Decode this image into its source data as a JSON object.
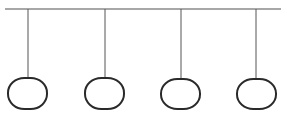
{
  "diagram": {
    "title": "",
    "colors": {
      "background": "#ffffff",
      "bar": "#8a8a8a",
      "string": "#555555",
      "pendant": "#2a2a2a"
    },
    "bar": {
      "x1": 5,
      "x2": 281,
      "y": 9
    },
    "pendants": [
      {
        "id": "pendant-1",
        "cx": 28,
        "stem_top": 9,
        "top": 78,
        "bottom": 109,
        "left": 8,
        "right": 47
      },
      {
        "id": "pendant-2",
        "cx": 105,
        "stem_top": 9,
        "top": 78,
        "bottom": 109,
        "left": 85,
        "right": 124
      },
      {
        "id": "pendant-3",
        "cx": 181,
        "stem_top": 9,
        "top": 79,
        "bottom": 109,
        "left": 161,
        "right": 200
      },
      {
        "id": "pendant-4",
        "cx": 256,
        "stem_top": 9,
        "top": 79,
        "bottom": 109,
        "left": 237,
        "right": 276
      }
    ]
  }
}
